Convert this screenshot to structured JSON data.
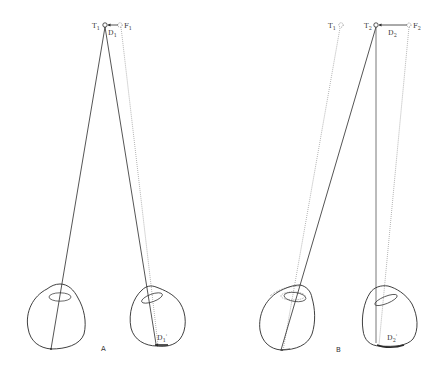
{
  "figure": {
    "background": "#ffffff",
    "ink_color": "#2a2a2a",
    "panels": [
      {
        "id": "A",
        "label": "A",
        "points": [
          {
            "name": "T",
            "sub": "1",
            "marker": "solid-circle"
          },
          {
            "name": "F",
            "sub": "1",
            "marker": "dashed-circle"
          }
        ],
        "displacement_label": {
          "name": "D",
          "sub": "1"
        },
        "retinal_displacement_label": {
          "name": "D",
          "sub": "1",
          "prime": "'"
        }
      },
      {
        "id": "B",
        "label": "B",
        "points": [
          {
            "name": "T",
            "sub": "1",
            "marker": "dashed-circle"
          },
          {
            "name": "T",
            "sub": "2",
            "marker": "solid-circle"
          },
          {
            "name": "F",
            "sub": "2",
            "marker": "dashed-circle"
          }
        ],
        "displacement_label": {
          "name": "D",
          "sub": "2"
        },
        "retinal_displacement_label": {
          "name": "D",
          "sub": "2",
          "prime": "'"
        }
      }
    ]
  }
}
